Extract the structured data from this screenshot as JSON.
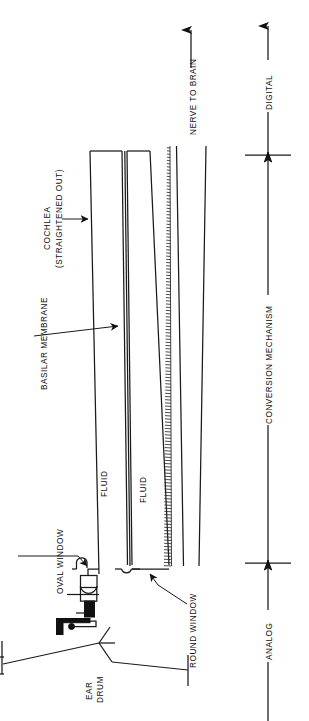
{
  "figure": {
    "orientation": "rotated-90-ccw",
    "ink_color": "#1a1a1a",
    "background_color": "#ffffff"
  },
  "labels": {
    "cochlea_line1": "COCHLEA",
    "cochlea_line2": "(STRAIGHTENED OUT)",
    "basilar_membrane": "BASILAR MEMBRANE",
    "oval_window": "OVAL WINDOW",
    "round_window": "ROUND WINDOW",
    "fluid_upper": "FLUID",
    "fluid_lower": "FLUID",
    "nerve_to_brain": "NERVE TO BRAIN",
    "ear_drum_line1": "EAR",
    "ear_drum_line2": "DRUM",
    "digital": "DIGITAL",
    "analog": "ANALOG",
    "conversion_mechanism": "CONVERSION MECHANISM"
  },
  "scale_axis": {
    "segments": [
      {
        "name": "analog",
        "label": "ANALOG"
      },
      {
        "name": "conversion",
        "label": "CONVERSION MECHANISM"
      },
      {
        "name": "digital",
        "label": "DIGITAL"
      }
    ],
    "tick_count": 2
  },
  "structures": [
    {
      "name": "ear-drum",
      "label": "EAR DRUM"
    },
    {
      "name": "ossicles",
      "label": ""
    },
    {
      "name": "oval-window",
      "label": "OVAL WINDOW"
    },
    {
      "name": "round-window",
      "label": "ROUND WINDOW"
    },
    {
      "name": "cochlea",
      "label": "COCHLEA (STRAIGHTENED OUT)"
    },
    {
      "name": "basilar-membrane",
      "label": "BASILAR MEMBRANE"
    },
    {
      "name": "hair-cells",
      "label": ""
    },
    {
      "name": "auditory-nerve",
      "label": "NERVE TO BRAIN"
    }
  ]
}
